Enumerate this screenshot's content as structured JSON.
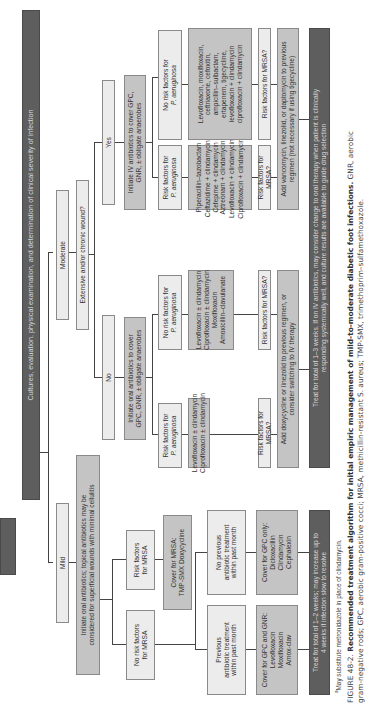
{
  "header": {
    "text": "Cultures, evaluation, physical examination, and determination of clinical severity of infection"
  },
  "severity": {
    "mild": "Mild",
    "moderate": "Moderate"
  },
  "mild_branch": {
    "initiate": [
      "Initiate oral antibiotics; topical antibiotics may be",
      "considered for superficial wounds with minimal cellulitis"
    ],
    "risk_mrsa": [
      "Risk factors",
      "for MRSA"
    ],
    "no_risk_mrsa": [
      "No risk factors",
      "for MRSA"
    ],
    "cover_mrsa": [
      "Cover for MRSA:",
      "TMP-SMX Doxycycline"
    ],
    "no_previous": [
      "No previous",
      "antibiotic treatment",
      "within past month"
    ],
    "previous": [
      "Previous",
      "antibiotic treatment",
      "within past month"
    ],
    "cover_gpc_only": [
      "Cover for GPC only:",
      "Dicloxacillin",
      "Clindamycin",
      "Cephalexin"
    ],
    "cover_gpc_gnr": [
      "Cover for GPC and GNR:",
      "Levofloxacin",
      "Moxifloxacin",
      "Amox-clav"
    ],
    "treat": [
      "Treat for total of 1–2 weeks; may increase up to",
      "4 weeks if infection slow to resolve"
    ]
  },
  "moderate_branch": {
    "question": "Extensive and/or chronic wound?",
    "no": "No",
    "yes": "Yes",
    "oral_init": [
      "Initiate oral antibiotics to cover",
      "GPC, GNR, ± obligate anaerobes"
    ],
    "iv_init": [
      "Initiate IV antibiotics to cover GPC,",
      "GNR, ± obligate anaerobes"
    ],
    "oral_risk_pa": [
      "Risk factors for",
      "P. aeruginosa"
    ],
    "oral_no_risk_pa": [
      "No risk factors for",
      "P. aeruginosa"
    ],
    "oral_risk_pa_drugs": [
      "Levofloxacin ± clindamycin",
      "Ciprofloxacin ± clindamycin"
    ],
    "oral_no_risk_pa_drugs": [
      "Levofloxacin ± clindamycin",
      "Ciprofloxacin ± clindamycin",
      "Moxifloxacin",
      "Amoxicillin–clavulanate"
    ],
    "iv_risk_pa": [
      "Risk factors for",
      "P. aeruginosa"
    ],
    "iv_no_risk_pa": [
      "No risk factors for",
      "P. aeruginosa"
    ],
    "iv_risk_pa_drugs": [
      "Piperacillin–tazobactam",
      "Ceftazidime + clindamycin",
      "Cefepime + clindamycin",
      "Aztreonam + clindamycin",
      "Levofloxacin + clindamycin",
      "Ciprofloxacin + clindamycin"
    ],
    "iv_risk_pa_drugs_sup": [
      "",
      "a",
      "",
      "",
      "a",
      "a"
    ],
    "iv_no_risk_pa_drugs": [
      "Levofloxacin, moxifloxacin,",
      "ceftriaxone, cefoxitin,",
      "ampicillin–sulbactam,",
      "ertapenem, tigecycline,",
      "levofloxacin + clindamycin",
      "ciprofloxacin + clindamycin"
    ],
    "risk_mrsa_q": "Risk factors for MRSA?",
    "oral_add": [
      "Add doxycycline or linezolid to previous regimen, or",
      "consider switching to IV therapy"
    ],
    "iv_add": [
      "Add vancomycin, linezolid, or daptomycin to previous",
      "regimen (not necessary if using tigecycline)"
    ],
    "oral_treat": [
      "Treat for total of 1–3 weeks. If on IV antibiotics, may consider change to oral therapy when patient is clinically",
      "responding systemically well, and culture results are available to guide drug selection"
    ]
  },
  "footnote": "May substitute metronidazole in place of clindamycin.",
  "footnote_marker": "a",
  "caption": {
    "label": "FIGURE 48-2.",
    "title": "Recommended treatment algorithm for initial empiric management of mild-to-moderate diabetic foot infections.",
    "body_line1": "GNR, aerobic",
    "body_line2": "gram-negative rods; GPC, aerobic gram-positive cocci; MRSA, methicillin-resistant S. aureus; TMP-SMX, trimethoprim–sulfamethoxazole."
  },
  "colors": {
    "dark": "#5e5e5e",
    "mid": "#c4c4c4",
    "light": "#ececec",
    "border": "#8a8a8a"
  }
}
